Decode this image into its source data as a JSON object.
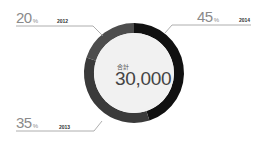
{
  "chart_data": {
    "type": "pie",
    "variant": "donut",
    "categories": [
      "2014",
      "2013",
      "2012"
    ],
    "values": [
      45,
      35,
      20
    ],
    "unit": "%",
    "colors": [
      "#111111",
      "#3a3a3a",
      "#4d4d4d"
    ],
    "center_label": "合計",
    "center_value": "30,000",
    "labels": [
      {
        "year": "2014",
        "percent": "45",
        "unit": "%"
      },
      {
        "year": "2013",
        "percent": "35",
        "unit": "%"
      },
      {
        "year": "2012",
        "percent": "20",
        "unit": "%"
      }
    ]
  }
}
